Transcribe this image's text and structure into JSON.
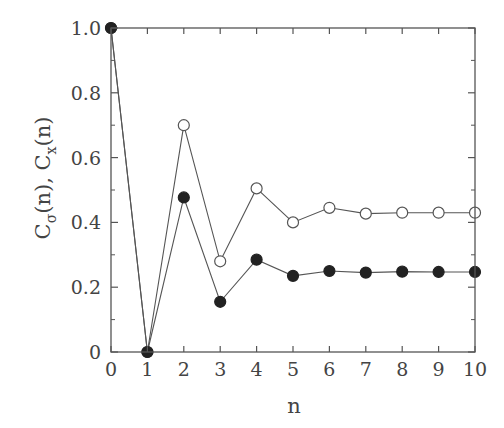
{
  "chart_data": {
    "type": "line",
    "title": "",
    "xlabel": "n",
    "ylabel": "C_σ(n), C_x(n)",
    "ylabel_parts": {
      "c1": "C",
      "s1": "σ",
      "a1": "(n), ",
      "c2": "C",
      "s2": "x",
      "a2": "(n)"
    },
    "x": [
      0,
      1,
      2,
      3,
      4,
      5,
      6,
      7,
      8,
      9,
      10
    ],
    "xlim": [
      0,
      10
    ],
    "ylim": [
      0,
      1.0
    ],
    "xticks": [
      "0",
      "1",
      "2",
      "3",
      "4",
      "5",
      "6",
      "7",
      "8",
      "9",
      "10"
    ],
    "yticks": [
      "0",
      "0.2",
      "0.4",
      "0.6",
      "0.8",
      "1.0"
    ],
    "ytick_values": [
      0,
      0.2,
      0.4,
      0.6,
      0.8,
      1.0
    ],
    "grid": false,
    "legend": null,
    "series": [
      {
        "name": "open circles",
        "marker": "open-circle",
        "values": [
          1.0,
          0.0,
          0.7,
          0.28,
          0.505,
          0.4,
          0.445,
          0.427,
          0.43,
          0.43,
          0.43
        ]
      },
      {
        "name": "filled circles",
        "marker": "filled-circle",
        "values": [
          1.0,
          0.0,
          0.477,
          0.155,
          0.285,
          0.235,
          0.25,
          0.245,
          0.248,
          0.247,
          0.247
        ]
      }
    ]
  }
}
